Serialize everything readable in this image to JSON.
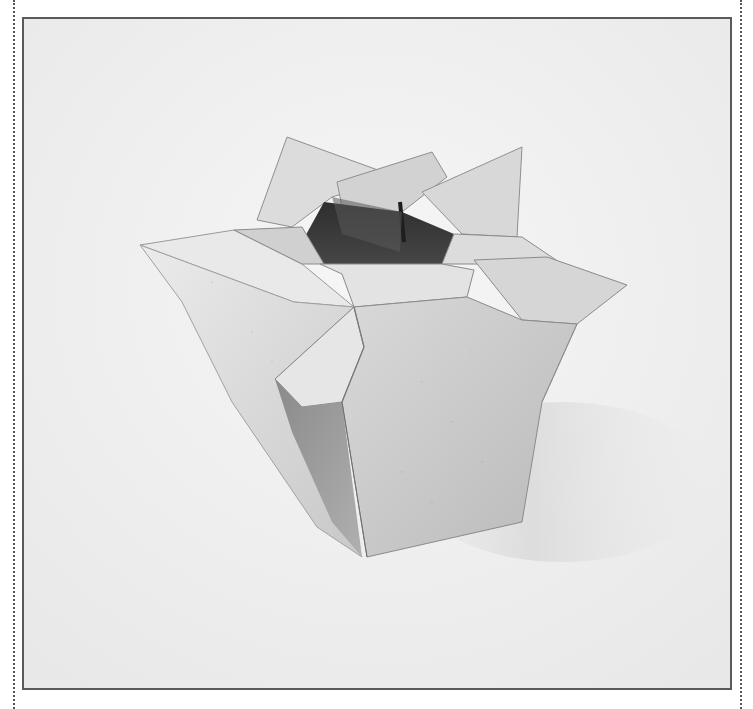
{
  "image": {
    "subject": "Origami vase photograph",
    "description": "Black-and-white photograph of a folded paper origami vase with a star-shaped pointed rim and dark open interior, set on a light textured background inside a bordered frame",
    "palette": {
      "background": "#f1f1f1",
      "paper_light": "#e6e6e6",
      "paper_mid": "#c9c9c9",
      "paper_dark": "#a9a9a9",
      "interior": "#3a3a3a",
      "frame_border": "#5a5a5a",
      "dotted_rule": "#555555"
    }
  }
}
